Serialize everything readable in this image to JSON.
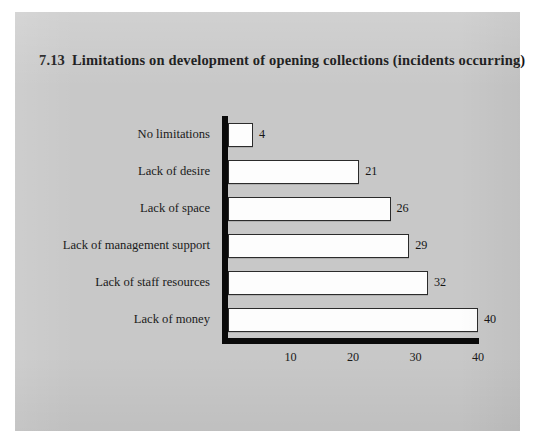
{
  "figure": {
    "background_color": "#ffffff",
    "panel_color": "#c8c8c8",
    "title_number": "7.13",
    "title_text": "Limitations on development of opening collections (incidents occurring)"
  },
  "chart_data": {
    "type": "bar",
    "orientation": "horizontal",
    "xlabel": "",
    "ylabel": "",
    "categories": [
      "No limitations",
      "Lack of desire",
      "Lack of space",
      "Lack of management support",
      "Lack of staff resources",
      "Lack of money"
    ],
    "values": [
      4,
      21,
      26,
      29,
      32,
      40
    ],
    "data_labels": [
      "4",
      "21",
      "26",
      "29",
      "32",
      "40"
    ],
    "xlim": [
      0,
      40
    ],
    "xticks": [
      10,
      20,
      30,
      40
    ],
    "xtick_labels": [
      "10",
      "20",
      "30",
      "40"
    ],
    "grid": false,
    "legend": false,
    "bar_fill_color": "#fdfdfd",
    "bar_edge_color": "#2b2b2b",
    "axis_color": "#0a0a0a"
  }
}
